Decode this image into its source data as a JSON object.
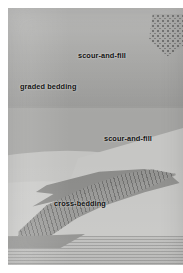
{
  "figure": {
    "name": "sedimentary-structures-illustration",
    "medium": "grayscale halftone drawing",
    "background_color": "#ffffff",
    "plate_color": "#a6a6a4"
  },
  "labels": [
    {
      "id": "scour-and-fill-upper",
      "text": "scour-and-fill"
    },
    {
      "id": "graded-bedding",
      "text": "graded bedding"
    },
    {
      "id": "scour-and-fill-right",
      "text": "scour-and-fill"
    },
    {
      "id": "cross-bedding",
      "text": "cross-bedding"
    }
  ],
  "label_style": {
    "color": "#111111",
    "weight": "bold",
    "case": "lowercase"
  },
  "regions": [
    {
      "id": "cobble-gravel-bed",
      "name": "coarse cobble conglomerate",
      "description": "large rounded clasts grading downward into finer grains",
      "tone": "#a3a3a1"
    },
    {
      "id": "graded-fining-zone",
      "name": "graded bedding fining-upward sequence",
      "description": "clast size decreases from top to bottom of the bed",
      "tone": "#9e9e9c"
    },
    {
      "id": "sand-body",
      "name": "fine sand fill beneath scour surface",
      "tone": "#c3c3c1"
    },
    {
      "id": "scour-surface-right",
      "name": "second erosional scour surface",
      "tone": "#c6c6c4"
    },
    {
      "id": "cross-bedded-lens",
      "name": "dark cross-bedded lens with inclined foresets",
      "tone": "#8b8b89"
    },
    {
      "id": "basal-laminae",
      "name": "horizontally laminated basal sand",
      "tone": "#b5b5b3"
    },
    {
      "id": "pebble-patch",
      "name": "fine pebble patch upper right",
      "tone": "#a0a09e"
    }
  ]
}
